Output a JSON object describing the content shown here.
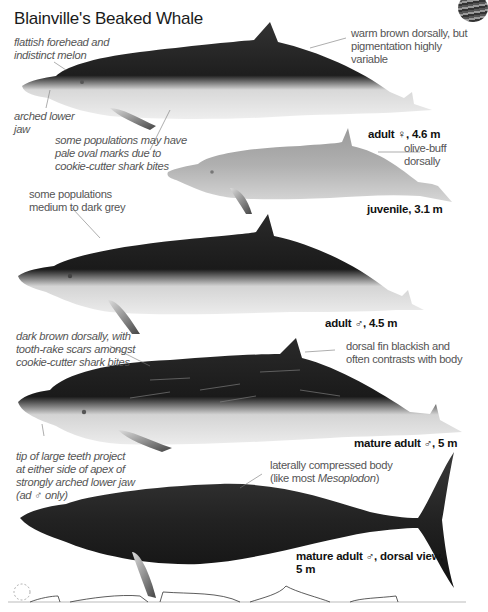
{
  "page": {
    "title": "Blainville's Beaked Whale"
  },
  "figures": [
    {
      "id": "adult-female",
      "caption": "adult ♀, 4.6 m",
      "annotations": [
        "flattish forehead and indistinct melon",
        "arched lower jaw",
        "some populations may have pale oval marks due to cookie-cutter shark bites",
        "warm brown dorsally, but pigmentation highly variable"
      ]
    },
    {
      "id": "juvenile",
      "caption": "juvenile, 3.1 m",
      "annotations": [
        "olive-buff dorsally"
      ]
    },
    {
      "id": "adult-male",
      "caption": "adult ♂, 4.5 m",
      "annotations": [
        "some populations medium to dark grey"
      ]
    },
    {
      "id": "mature-adult-male",
      "caption": "mature adult ♂, 5 m",
      "annotations": [
        "dark brown dorsally, with tooth-rake scars amongst cookie-cutter shark bites",
        "dorsal fin blackish and often contrasts with body",
        "tip of large teeth project at either side of apex of strongly arched lower jaw (ad ♂ only)"
      ]
    },
    {
      "id": "mature-adult-male-dorsal",
      "caption_line1": "mature adult ♂, dorsal view,",
      "caption_line2": "5 m",
      "annotations_pre": "laterally compressed body",
      "annotations_paren_open": "(like most ",
      "annotations_genus": "Mesoplodon",
      "annotations_paren_close": ")"
    }
  ],
  "labels": {
    "a_forehead_1": "flattish forehead and",
    "a_forehead_2": "indistinct melon",
    "a_jaw_1": "arched lower",
    "a_jaw_2": "jaw",
    "a_marks_1": "some populations may have",
    "a_marks_2": "pale oval marks due to",
    "a_marks_3": "cookie-cutter shark bites",
    "a_warm_1": "warm brown dorsally, but",
    "a_warm_2": "pigmentation highly variable",
    "j_olive_1": "olive-buff",
    "j_olive_2": "dorsally",
    "m_grey_1": "some populations",
    "m_grey_2": "medium to dark grey",
    "ma_brown_1": "dark brown dorsally, with",
    "ma_brown_2": "tooth-rake scars amongst",
    "ma_brown_3": "cookie-cutter shark bites",
    "ma_fin_1": "dorsal fin blackish and",
    "ma_fin_2": "often contrasts with body",
    "ma_teeth_1": "tip of large teeth project",
    "ma_teeth_2": "at either side of apex of",
    "ma_teeth_3": "strongly arched lower jaw",
    "ma_teeth_4": "(ad ♂ only)",
    "d_body_1": "laterally compressed body"
  },
  "colors": {
    "text_note": "#555555",
    "text_caption": "#111111",
    "whale_dark": "#1c1c1c",
    "whale_belly": "#e6e6e6",
    "juvenile_body": "#b4b4b4"
  }
}
